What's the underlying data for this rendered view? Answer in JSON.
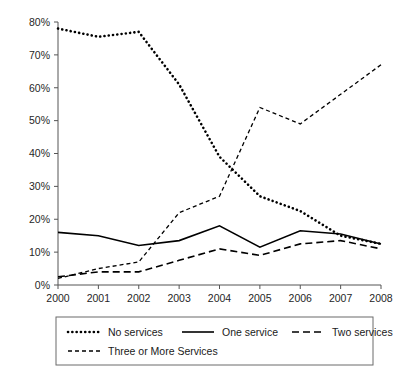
{
  "chart_data": {
    "type": "line",
    "title": "",
    "subtitle": "",
    "xlabel": "",
    "ylabel": "",
    "categories": [
      "2000",
      "2001",
      "2002",
      "2003",
      "2004",
      "2005",
      "2006",
      "2007",
      "2008"
    ],
    "x": [
      2000,
      2001,
      2002,
      2003,
      2004,
      2005,
      2006,
      2007,
      2008
    ],
    "ylim": [
      0,
      80
    ],
    "yticks": [
      0,
      10,
      20,
      30,
      40,
      50,
      60,
      70,
      80
    ],
    "ytick_labels": [
      "0%",
      "10%",
      "20%",
      "30%",
      "40%",
      "50%",
      "60%",
      "70%",
      "80%"
    ],
    "xtick_labels": [
      "2000",
      "2001",
      "2002",
      "2003",
      "2004",
      "2005",
      "2006",
      "2007",
      "2008"
    ],
    "grid": false,
    "legend_position": "bottom",
    "units": "percent",
    "series": [
      {
        "name": "No services",
        "style": "dotted",
        "color": "#000000",
        "values": [
          78,
          75.5,
          77,
          61,
          39,
          27,
          22.5,
          15,
          12.5
        ]
      },
      {
        "name": "One service",
        "style": "solid",
        "color": "#000000",
        "values": [
          16,
          15,
          12,
          13.5,
          18,
          11.5,
          16.5,
          15.5,
          12.5
        ]
      },
      {
        "name": "Two services",
        "style": "dashed",
        "color": "#000000",
        "values": [
          2.5,
          4,
          4,
          7.5,
          11,
          9,
          12.5,
          13.5,
          11
        ]
      },
      {
        "name": "Three or More Services",
        "style": "fine-dashed",
        "color": "#000000",
        "values": [
          2,
          5,
          7,
          22,
          27,
          54,
          49,
          58,
          67
        ]
      }
    ]
  },
  "legend": {
    "entries": [
      {
        "label": "No services",
        "style": "dotted"
      },
      {
        "label": "One service",
        "style": "solid"
      },
      {
        "label": "Two services",
        "style": "dashed"
      },
      {
        "label": "Three or More Services",
        "style": "fine-dashed"
      }
    ]
  }
}
